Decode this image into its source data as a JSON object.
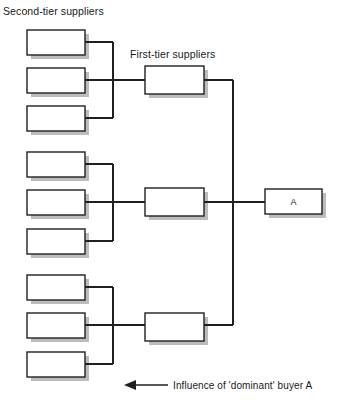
{
  "diagram": {
    "type": "supply-chain-tier-diagram",
    "background_color": "#ffffff",
    "line_color": "#231f20",
    "box_fill": "#ffffff",
    "box_stroke": "#231f20",
    "shadow_color": "#b7b7b7",
    "captions": {
      "second_tier": "Second-tier suppliers",
      "first_tier": "First-tier suppliers"
    },
    "legend": {
      "arrow_label": "Influence of 'dominant' buyer A",
      "arrow_direction": "left"
    },
    "buyer": {
      "label": "A"
    },
    "second_tier_groups": [
      {
        "group": 1,
        "boxes": [
          {
            "label": ""
          },
          {
            "label": ""
          },
          {
            "label": ""
          }
        ]
      },
      {
        "group": 2,
        "boxes": [
          {
            "label": ""
          },
          {
            "label": ""
          },
          {
            "label": ""
          }
        ]
      },
      {
        "group": 3,
        "boxes": [
          {
            "label": ""
          },
          {
            "label": ""
          },
          {
            "label": ""
          }
        ]
      }
    ],
    "first_tier_boxes": [
      {
        "label": ""
      },
      {
        "label": ""
      },
      {
        "label": ""
      }
    ]
  }
}
